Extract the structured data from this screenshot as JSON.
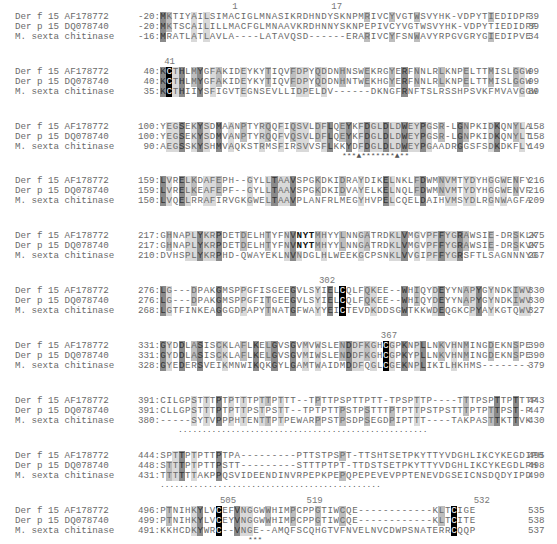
{
  "figure": {
    "type": "multiple-sequence-alignment",
    "sequence_names": [
      "Der f 15 AF178772",
      "Der p 15 DQ078740",
      "M. sexta chitinase"
    ],
    "blocks": [
      {
        "position_labels": [
          {
            "label": "1",
            "col": 12
          },
          {
            "label": "17",
            "col": 28
          }
        ],
        "rows": [
          {
            "name": "Der f 15 AF178772",
            "start": "-20:",
            "seq": "MKTIYAILSIMACIGLMNASIKRDHNDYSKNPMRIVCYVGTWSVYHK-VDPYTIEDIDPF",
            "end": "39"
          },
          {
            "name": "Der p 15 DQ078740",
            "start": "-20:",
            "seq": "MKTSCAILILLMACFGLMNAAVKRDHNNYSKNPEPIVCYVGTWSVYHK-VDPYTIEDIDPF",
            "end": "39"
          },
          {
            "name": "M. sexta chitinase",
            "start": "-16:",
            "seq": "MRATLATLAVLA----LATAVQSD------ERARIVCYFSNWAVYRPGVGRYGIEDIPVE",
            "end": "34"
          }
        ],
        "footer": ""
      },
      {
        "position_labels": [
          {
            "label": "41",
            "col": 1
          }
        ],
        "rows": [
          {
            "name": "Der f 15 AF178772",
            "start": "40:",
            "seq": "KCTHLMYGFAKIDEYKYTIQVFDPYQDDNHNSWEKRGYERFNNLRLKNPELTTMISLGGW",
            "end": "99"
          },
          {
            "name": "Der p 15 DQ078740",
            "start": "40:",
            "seq": "KCTHLMYGFAKIDEYKYTIQVFDPYQDDNHNTWEKHGYERFNNLRLKNPELTTMISLGGW",
            "end": "99"
          },
          {
            "name": "M. sexta chitinase",
            "start": "35:",
            "seq": "KCTHIIYSFIGVTEGNSEVLLIDPELDV------DKNGFRNFTSLRSSHPSVKFMVAVGGW",
            "end": "89"
          }
        ],
        "footer": ""
      },
      {
        "position_labels": [],
        "rows": [
          {
            "name": "Der f 15 AF178772",
            "start": "100:",
            "seq": "YEGSEKYSDMAANPTYRQQFIQSVLDFLQEYKFDGLDLDWEYPGSR-LGNPKIDKQNYLA",
            "end": "158"
          },
          {
            "name": "Der p 15 DQ078740",
            "start": "100:",
            "seq": "YEGSEKYSDMVANPTYRQQFVQSVLDFLQEYKFDGLDLDWEYPGSR-LGNPKIDKQNYLT",
            "end": "158"
          },
          {
            "name": "M. sexta chitinase",
            "start": "90:",
            "seq": "AEGSSKYSHMVAQKSTRMSFIRSVVSFLKKYDFDGLDLDWEYPGAADRGGSFSDKDKFLY",
            "end": "149"
          }
        ],
        "footer": "***▲*******▲**"
      },
      {
        "position_labels": [],
        "rows": [
          {
            "name": "Der f 15 AF178772",
            "start": "159:",
            "seq": "LVRELKDAFEPH--GYLLTAAVSPGKDKIDRAYDIKELNKLFDWMNVMTYDYHGGWENFY",
            "end": "216"
          },
          {
            "name": "Der p 15 DQ078740",
            "start": "159:",
            "seq": "LVRELKEAFEPF--GYLLTAAVSPGKDKIDVAYELKELNQLFDWMNVMTYDYHGGWENVF",
            "end": "216"
          },
          {
            "name": "M. sexta chitinase",
            "start": "150:",
            "seq": "LVQELRRAFIRVGKGWELTAAVPLANFRLMEGYHVPELCQELDAIHVMSYDLRGNWAGFA",
            "end": "209"
          }
        ],
        "footer": ""
      },
      {
        "position_labels": [],
        "rows": [
          {
            "name": "Der f 15 AF178772",
            "start": "217:",
            "seq": "GHNAPLYKRPDETDELHTYFNVNYTMHYYLNNGATRDKLVMGVPFFYGRAWSIE-DRSKLK",
            "end": "275"
          },
          {
            "name": "Der p 15 DQ078740",
            "start": "217:",
            "seq": "GHNAPLYKRPDETDELHTYFNVNYTMHYYLNNGATRDKLVMGVPFFYGRAWSIE-DRSKVK",
            "end": "275"
          },
          {
            "name": "M. sexta chitinase",
            "start": "210:",
            "seq": "DVHSPLYKRPHD-QWAYEKLNVNDGLHLWEEKGCPSNKLVVGIPFFYGRSFTLSAGNNNYG",
            "end": "267"
          }
        ],
        "bold_motif": "NYT",
        "footer": ""
      },
      {
        "position_labels": [
          {
            "label": "302",
            "col": 26
          }
        ],
        "rows": [
          {
            "name": "Der f 15 AF178772",
            "start": "276:",
            "seq": "LG---DPAKGMSPPGFISGEEGVLSYIELCQLFQKEE--WHIQYDEYYNAPYGYNDKIWV",
            "end": "330"
          },
          {
            "name": "Der p 15 DQ078740",
            "start": "276:",
            "seq": "LG---DPAKGMSPPGFITGEEGVLSYIELCQLFQKEE--WHIQYDEYYNAPYGYNDKIWV",
            "end": "330"
          },
          {
            "name": "M. sexta chitinase",
            "start": "268:",
            "seq": "LGTFINKEAGGGDPAPYTNATGFWAYYEICTEVDKDDSGWTKKWDEQGKCPYAYKGTQWV",
            "end": "327"
          }
        ],
        "footer": ""
      },
      {
        "position_labels": [
          {
            "label": "367",
            "col": 36
          }
        ],
        "rows": [
          {
            "name": "Der f 15 AF178772",
            "start": "331:",
            "seq": "GYDDLASISCKLAFLKELGVSGVMVWSLENDDFKGHCGPKNPLLNKVHNMINGDEKNSPE",
            "end": "390"
          },
          {
            "name": "Der p 15 DQ078740",
            "start": "331:",
            "seq": "GYDDLASISCKLAFLKELGVSGVMIWSLENDDFKGHCGPKYPLLNKVHNMINGDEKNSPE",
            "end": "390"
          },
          {
            "name": "M. sexta chitinase",
            "start": "328:",
            "seq": "GYEDERSVEIKMNWIKQKGYLGAMTWAIDMDDFQGLCGEKNPLIKILHKHMS--------",
            "end": "379"
          }
        ],
        "footer": ""
      },
      {
        "position_labels": [],
        "rows": [
          {
            "name": "Der f 15 AF178772",
            "start": "391:",
            "seq": "CILGPSTTTPTPTTTPTTPTTT--TPTTPSPTTPTT-TPSPTTP----TTTPSPTTPTTTP",
            "end": "443"
          },
          {
            "name": "Der p 15 DQ078740",
            "start": "391:",
            "seq": "CLLGPSTTTPTPTTPSTPSTT--TPTPTTPSTPSTTTPTPTTPSTPSTTTPTPTTPST-P",
            "end": "447"
          },
          {
            "name": "M. sexta chitinase",
            "start": "380:",
            "seq": "-----SYTVPPPHTENTTPTPEWARPPSTPSDPSEGDPIPTTT----TAKPASTTKTTVK",
            "end": "430"
          }
        ],
        "footer": "...................................................."
      },
      {
        "position_labels": [],
        "rows": [
          {
            "name": "Der f 15 AF178772",
            "start": "444:",
            "seq": "SPTTPTPTTPTPA---------PTTSTPSPT-TTSHTSETPKYTTYVDGHLIKCYKEGDIPH",
            "end": "495"
          },
          {
            "name": "Der p 15 DQ078740",
            "start": "448:",
            "seq": "STTTPTPTTPSTT---------STTTPTPT-TTDSTSETPKYTTYVDGHLIKCYKEGDLPH",
            "end": "498"
          },
          {
            "name": "M. sexta chitinase",
            "start": "431:",
            "seq": "TTTTTTAKPPQSVIDEENDINVRPEPKPEPQPEPEVEVPPTENEVDGSEICNSDQDYIPD",
            "end": "490"
          }
        ],
        "footer": ".............................................."
      },
      {
        "position_labels": [
          {
            "label": "505",
            "col": 10
          },
          {
            "label": "519",
            "col": 24
          },
          {
            "label": "532",
            "col": 51
          }
        ],
        "rows": [
          {
            "name": "Der f 15 AF178772",
            "start": "496:",
            "seq": "PTNIHKYLVCEFVNGGWWHIMPCPPGTIWCQE------------KLTCIGE",
            "end": "535"
          },
          {
            "name": "Der p 15 DQ078740",
            "start": "499:",
            "seq": "PTNIHKYLVCEYVNGGWWHIMPCPPGTIWCQE------------KLTCITE",
            "end": "538"
          },
          {
            "name": "M. sexta chitinase",
            "start": "491:",
            "seq": "KKHCDKYWRC--VNGE--AMQFSCQHGTVFNVELNVCDWPSNATERRCQQP",
            "end": "537"
          }
        ],
        "footer": "***"
      }
    ],
    "shading_legend": {
      "black": "invariant cysteine",
      "dark_gray": "identical in all sequences",
      "light_gray": "conserved/similar"
    },
    "colors": {
      "black": "#000000",
      "dark": "#8a8a8a",
      "mid": "#bdbdbd",
      "light": "#d9d9d9",
      "text": "#6a6a6a"
    }
  }
}
